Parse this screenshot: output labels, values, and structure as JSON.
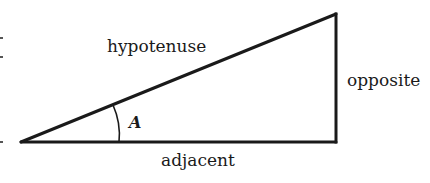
{
  "diagram": {
    "type": "right-triangle",
    "labels": {
      "hypotenuse": "hypotenuse",
      "opposite": "opposite",
      "adjacent": "adjacent",
      "angle": "A"
    },
    "colors": {
      "stroke": "#1a1a1a",
      "background": "#ffffff"
    },
    "vertices": {
      "angle_vertex": [
        21,
        142
      ],
      "top_right": [
        336,
        14
      ],
      "right_angle": [
        336,
        142
      ]
    }
  }
}
